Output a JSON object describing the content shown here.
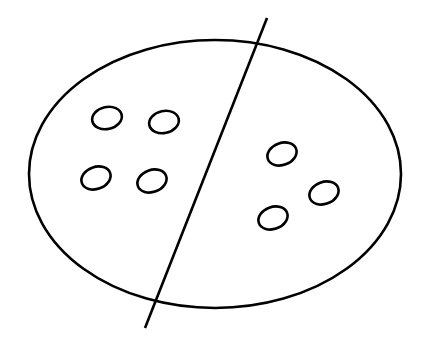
{
  "diagram": {
    "stroke_color": "#000000",
    "background": "#ffffff",
    "left_count": 4,
    "right_count": 3
  }
}
